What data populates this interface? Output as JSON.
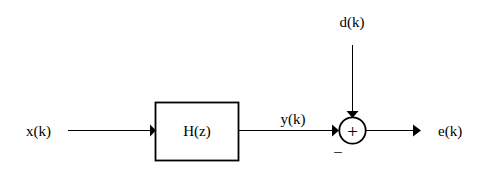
{
  "diagram": {
    "type": "signal-flow-block-diagram",
    "canvas": {
      "width": 488,
      "height": 173,
      "background": "#ffffff"
    },
    "stroke_color": "#000000",
    "labels": {
      "input_signal": "x(k)",
      "filter_block": "H(z)",
      "filter_output": "y(k)",
      "desired_signal": "d(k)",
      "error_output": "e(k)",
      "sum_plus": "+",
      "sum_minus": "_"
    },
    "nodes": [
      {
        "id": "input",
        "label": "x(k)",
        "kind": "signal-source",
        "x": 41,
        "y": 131
      },
      {
        "id": "filter",
        "label": "H(z)",
        "kind": "transfer-function-block",
        "x": 197,
        "y": 131,
        "box": {
          "x": 155,
          "y": 102,
          "width": 84,
          "height": 59
        }
      },
      {
        "id": "filter-output",
        "label": "y(k)",
        "kind": "signal-label",
        "x": 293,
        "y": 118
      },
      {
        "id": "desired",
        "label": "d(k)",
        "kind": "signal-source",
        "x": 352,
        "y": 22
      },
      {
        "id": "summer",
        "label": "+",
        "kind": "summing-junction",
        "cx": 352.5,
        "cy": 130.5,
        "r": 13.5
      },
      {
        "id": "error",
        "label": "e(k)",
        "kind": "signal-sink",
        "x": 455,
        "y": 131
      }
    ],
    "edges": [
      {
        "from": "input",
        "to": "filter",
        "orientation": "horizontal",
        "x1": 68,
        "x2": 155,
        "y": 130.5,
        "arrow": "end"
      },
      {
        "from": "filter",
        "to": "summer",
        "orientation": "horizontal",
        "x1": 239,
        "x2": 339,
        "y": 130.5,
        "arrow": "end",
        "sign": "_"
      },
      {
        "from": "desired",
        "to": "summer",
        "orientation": "vertical",
        "x": 352.5,
        "y1": 45,
        "y2": 117,
        "arrow": "end",
        "sign": "+"
      },
      {
        "from": "summer",
        "to": "error",
        "orientation": "horizontal",
        "x1": 366,
        "x2": 421,
        "y": 130.5,
        "arrow": "end"
      }
    ]
  }
}
